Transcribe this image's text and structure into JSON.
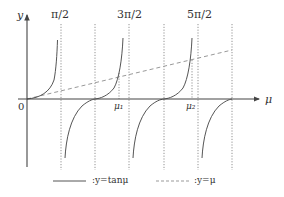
{
  "diagram": {
    "title": "",
    "axes": {
      "y_label": "y",
      "x_label": "μ",
      "origin_label": "0"
    },
    "asymptote_labels": [
      "π/2",
      "3π/2",
      "5π/2"
    ],
    "intersection_labels": [
      "μ₁",
      "μ₂"
    ],
    "legend": [
      {
        "style": "solid",
        "label": ":y=tanμ"
      },
      {
        "style": "dashed",
        "label": ":y=μ"
      }
    ],
    "curves": [
      {
        "name": "y = tan μ",
        "style": "solid",
        "color": "#555555"
      },
      {
        "name": "y = μ",
        "style": "dashed",
        "color": "#888888"
      }
    ],
    "colors": {
      "axis": "#444444",
      "curve": "#555555",
      "dashed": "#999999",
      "asymptote": "#777777"
    }
  }
}
